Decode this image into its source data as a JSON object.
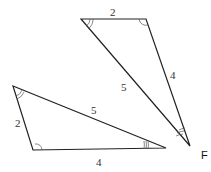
{
  "figure": {
    "label": "F",
    "triangle_top": {
      "sides": {
        "top": "2",
        "right": "4",
        "hypotenuse": "5"
      }
    },
    "triangle_bottom": {
      "sides": {
        "left": "2",
        "bottom": "4",
        "hypotenuse": "5"
      }
    }
  }
}
